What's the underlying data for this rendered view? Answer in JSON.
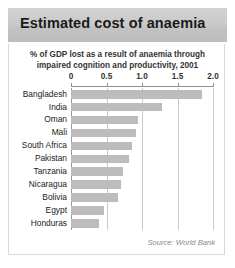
{
  "header": {
    "title": "Estimated cost of anaemia"
  },
  "panel": {
    "subtitle_line1": "% of GDP lost as a result of anaemia through",
    "subtitle_line2": "impaired cognition and productivity, 2001",
    "source": "Source: World Bank"
  },
  "colors": {
    "header_background": "#c8c8c8",
    "bar": "#bcbcbc",
    "gridline": "#c9c9c9",
    "axis": "#8e8e8e",
    "panel_border": "#d8d8d8",
    "title_text": "#1a1a1a",
    "source_text": "#8a8a8a"
  },
  "chart_data": {
    "type": "bar",
    "orientation": "horizontal",
    "title": "Estimated cost of anaemia",
    "subtitle": "% of GDP lost as a result of anaemia through impaired cognition and productivity, 2001",
    "xlabel": "",
    "ylabel": "",
    "xlim": [
      0,
      2.0
    ],
    "xticks": [
      0,
      0.5,
      1.0,
      1.5,
      2.0
    ],
    "xtick_labels": [
      "0",
      "0.5",
      "1.0",
      "1.5",
      "2.0"
    ],
    "grid": true,
    "legend": "none",
    "source": "Source: World Bank",
    "categories": [
      "Bangladesh",
      "India",
      "Oman",
      "Mali",
      "South Africa",
      "Pakistan",
      "Tanzania",
      "Nicaragua",
      "Bolivia",
      "Egypt",
      "Honduras"
    ],
    "values": [
      1.85,
      1.28,
      0.95,
      0.92,
      0.86,
      0.81,
      0.73,
      0.71,
      0.66,
      0.46,
      0.39
    ]
  }
}
